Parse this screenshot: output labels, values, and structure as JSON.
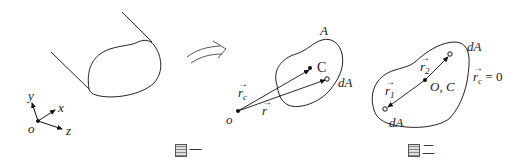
{
  "figure1": {
    "caption_glyph": "图",
    "caption_number": "一",
    "axes": {
      "origin": "o",
      "x": "x",
      "y": "y",
      "z": "z"
    },
    "shape": "extruded cross-section (prism)",
    "points": {
      "origin": "o",
      "centroid": "C",
      "element": "dA",
      "area": "A"
    },
    "vectors": {
      "rc": "r",
      "rc_sub": "c",
      "r": "r"
    }
  },
  "transition_arrow": "curved-arrow",
  "figure2": {
    "caption_glyph": "图",
    "caption_number": "二",
    "center_label": "O, C",
    "element_top": "dA",
    "element_bottom": "dA",
    "vector_r1": "r",
    "vector_r1_sub": "1",
    "vector_r2": "r",
    "vector_r2_sub": "2",
    "equation_lhs": "r",
    "equation_lhs_sub": "c",
    "equation_rhs": " = 0"
  }
}
